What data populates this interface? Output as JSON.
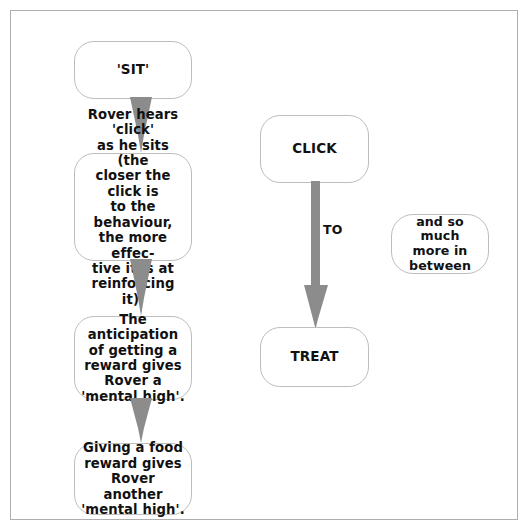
{
  "diagram": {
    "colors": {
      "arrow": "#8c8c8c",
      "node_border": "#bdbdbd",
      "frame_border": "#aeaeae",
      "background": "#ffffff",
      "text": "#111111"
    },
    "nodes": [
      {
        "id": "sit",
        "label": "'SIT'"
      },
      {
        "id": "rover_hears",
        "label": "Rover hears 'click'\nas he sits (the\ncloser the click is\nto the behaviour,\nthe more effec-\ntive it is at\nreinforcing it)."
      },
      {
        "id": "anticipation",
        "label": "The anticipation\nof getting a\nreward gives\nRover a\n'mental high'."
      },
      {
        "id": "giving_food",
        "label": "Giving a food\nreward gives\nRover another\n'mental high'."
      },
      {
        "id": "click",
        "label": "CLICK"
      },
      {
        "id": "treat",
        "label": "TREAT"
      },
      {
        "id": "between",
        "label": "and so much\nmore in\nbetween"
      }
    ],
    "edges": [
      {
        "id": "sit_to_hears",
        "from": "sit",
        "to": "rover_hears",
        "label": ""
      },
      {
        "id": "hears_to_antic",
        "from": "rover_hears",
        "to": "anticipation",
        "label": ""
      },
      {
        "id": "antic_to_giving",
        "from": "anticipation",
        "to": "giving_food",
        "label": ""
      },
      {
        "id": "click_to_treat",
        "from": "click",
        "to": "treat",
        "label": "TO"
      }
    ]
  }
}
